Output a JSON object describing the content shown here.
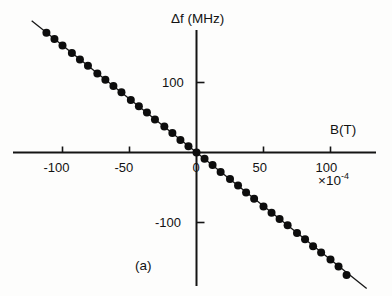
{
  "figure": {
    "caption": "(a)",
    "background": "#fdfdfc",
    "ink_color": "#121212"
  },
  "chart_data": {
    "type": "scatter",
    "title": "",
    "subtitle": "",
    "xlabel": "B(T)",
    "ylabel": "Δf  (MHz)",
    "x_multiplier": "×10",
    "x_multiplier_exponent": "-4",
    "grid": false,
    "legend": null,
    "axis_style": "crossed-at-origin",
    "xlim": [
      -130,
      135
    ],
    "ylim": [
      -190,
      175
    ],
    "xticks": [
      -100,
      -50,
      0,
      50,
      100
    ],
    "xtick_labels": [
      "-100",
      "-50",
      "0",
      "50",
      "100"
    ],
    "yticks": [
      100,
      -100
    ],
    "ytick_labels": [
      "100",
      "-100"
    ],
    "fit_line": {
      "slope": -1.53,
      "intercept": 0.0,
      "x_start": -123,
      "x_end": 127,
      "color": "#161616"
    },
    "marker": {
      "shape": "filled-circle",
      "color": "#0d0d0d",
      "size_px": 8
    },
    "x": [
      -112,
      -106,
      -100,
      -93,
      -87,
      -81,
      -74,
      -68,
      -62,
      -56,
      -49,
      -43,
      -37,
      -31,
      -24,
      -18,
      -12,
      -6,
      0,
      6,
      12,
      18,
      25,
      31,
      37,
      43,
      50,
      56,
      62,
      68,
      75,
      81,
      87,
      93,
      100,
      106,
      112
    ],
    "y": [
      171,
      162,
      153,
      142,
      133,
      124,
      113,
      104,
      95,
      86,
      75,
      66,
      57,
      47,
      37,
      28,
      18,
      9,
      0,
      -9,
      -18,
      -28,
      -38,
      -47,
      -57,
      -66,
      -77,
      -86,
      -95,
      -104,
      -115,
      -124,
      -134,
      -143,
      -153,
      -163,
      -175
    ],
    "series_name": "Δf vs B"
  }
}
